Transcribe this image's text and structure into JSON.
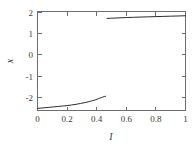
{
  "chart_data": {
    "type": "line",
    "title": "",
    "subtitle": "",
    "xlabel": "I",
    "ylabel": "x",
    "xlim": [
      0,
      1
    ],
    "ylim": [
      -2.65,
      2.0
    ],
    "grid": false,
    "legend": false,
    "legend_position": "none",
    "x_ticks": [
      0,
      0.2,
      0.4,
      0.6,
      0.8,
      1
    ],
    "x_tick_labels": [
      "0",
      "0.2",
      "0.4",
      "0.6",
      "0.8",
      "1"
    ],
    "y_ticks": [
      -2,
      -1,
      0,
      1,
      2
    ],
    "y_tick_labels": [
      "-2",
      "-1",
      "0",
      "1",
      "2"
    ],
    "line_color": "#2b2b2b",
    "frame_color": "#6e6e6e",
    "background_color": "#ffffff",
    "series": [
      {
        "name": "lower-branch",
        "x": [
          0.0,
          0.02,
          0.05,
          0.08,
          0.11,
          0.14,
          0.17,
          0.2,
          0.23,
          0.26,
          0.29,
          0.32,
          0.35,
          0.37,
          0.39,
          0.41,
          0.42,
          0.43,
          0.44,
          0.45,
          0.455,
          0.46
        ],
        "y": [
          -2.55,
          -2.54,
          -2.52,
          -2.5,
          -2.48,
          -2.46,
          -2.44,
          -2.42,
          -2.39,
          -2.36,
          -2.32,
          -2.28,
          -2.23,
          -2.19,
          -2.15,
          -2.1,
          -2.07,
          -2.05,
          -2.02,
          -2.0,
          -1.99,
          -1.98
        ]
      },
      {
        "name": "upper-branch",
        "x": [
          0.47,
          0.5,
          0.55,
          0.6,
          0.65,
          0.7,
          0.75,
          0.8,
          0.85,
          0.9,
          0.95,
          1.0
        ],
        "y": [
          1.675,
          1.685,
          1.7,
          1.715,
          1.727,
          1.739,
          1.75,
          1.76,
          1.77,
          1.78,
          1.79,
          1.8
        ]
      }
    ]
  },
  "axes": {
    "x_title": "I",
    "y_title": "x"
  }
}
